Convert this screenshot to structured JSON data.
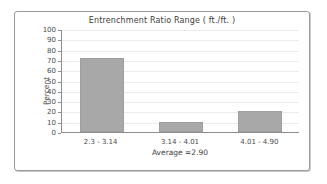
{
  "chart_data": {
    "type": "bar",
    "title": "Entrenchment Ratio Range ( ft./ft. )",
    "categories": [
      "2.3 - 3.14",
      "3.14 - 4.01",
      "4.01 - 4.90"
    ],
    "values": [
      72,
      10,
      20
    ],
    "xlabel": "Average =2.90",
    "ylabel": "Percent",
    "ylim": [
      0,
      100
    ],
    "ytick_labels": [
      "100",
      "90",
      "80",
      "70",
      "60",
      "50",
      "40",
      "30",
      "20",
      "10",
      "0"
    ],
    "ytick_values": [
      100,
      90,
      80,
      70,
      60,
      50,
      40,
      30,
      20,
      10,
      0
    ],
    "grid": "horizontal",
    "legend": "none",
    "series_color": "#a8a8a8",
    "gridline_color": "#ececec",
    "axis_color": "#8d8d8d",
    "frame_color": "#9a9a9a"
  }
}
